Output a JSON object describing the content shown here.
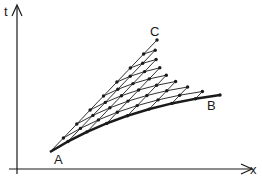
{
  "figure": {
    "axes": {
      "t_label": "t",
      "x_label": "x"
    },
    "points": {
      "A": {
        "label": "A",
        "x": 50,
        "y": 152
      },
      "B": {
        "label": "B",
        "x": 220,
        "y": 95
      },
      "C": {
        "label": "C",
        "x": 157,
        "y": 40
      }
    },
    "mesh": {
      "divisions": 8,
      "description": "characteristic grid between curve AB and point C"
    },
    "colors": {
      "ink": "#1a1a1a",
      "background": "#ffffff"
    }
  }
}
